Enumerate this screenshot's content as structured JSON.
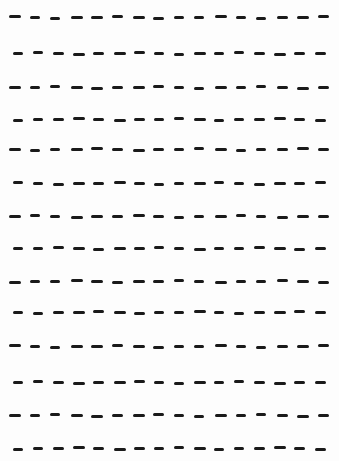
{
  "document": {
    "type": "dashed-line-worksheet",
    "background_color": "#fdfdfd",
    "ink_color": "#1a1a1a",
    "dashes_per_row": 16,
    "dash_height": 3,
    "row_patterns": {
      "A": {
        "start_x": 9,
        "pitch": 20.6,
        "widths": [
          12,
          10,
          10,
          12,
          12,
          11,
          12,
          11,
          10,
          10,
          12,
          10,
          10,
          11,
          12,
          11
        ]
      },
      "B": {
        "start_x": 13,
        "pitch": 20.1,
        "widths": [
          10,
          10,
          11,
          12,
          11,
          12,
          11,
          10,
          10,
          12,
          10,
          10,
          11,
          12,
          11,
          11
        ]
      }
    },
    "rows": [
      {
        "y": 15,
        "pattern": "A"
      },
      {
        "y": 51,
        "pattern": "B"
      },
      {
        "y": 85,
        "pattern": "A"
      },
      {
        "y": 117,
        "pattern": "B"
      },
      {
        "y": 147,
        "pattern": "A"
      },
      {
        "y": 181,
        "pattern": "B"
      },
      {
        "y": 214,
        "pattern": "A"
      },
      {
        "y": 246,
        "pattern": "B"
      },
      {
        "y": 279,
        "pattern": "A"
      },
      {
        "y": 310,
        "pattern": "B"
      },
      {
        "y": 344,
        "pattern": "A"
      },
      {
        "y": 380,
        "pattern": "B"
      },
      {
        "y": 413,
        "pattern": "A"
      },
      {
        "y": 446,
        "pattern": "B"
      }
    ]
  }
}
